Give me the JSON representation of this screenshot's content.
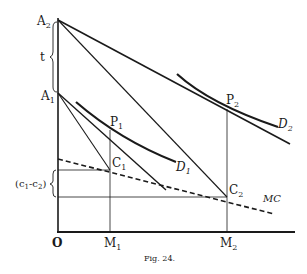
{
  "figure": {
    "caption": "Fig. 24.",
    "ink_color": "#1a1a1a",
    "background": "#ffffff"
  },
  "axes": {
    "origin_label": "O",
    "x_ticks": [
      {
        "label": "M",
        "sub": "1"
      },
      {
        "label": "M",
        "sub": "2"
      }
    ]
  },
  "points": {
    "A2": {
      "label": "A",
      "sub": "2"
    },
    "A1": {
      "label": "A",
      "sub": "1"
    },
    "P1": {
      "label": "P",
      "sub": "1"
    },
    "P2": {
      "label": "P",
      "sub": "2"
    },
    "C1": {
      "label": "C",
      "sub": "1"
    },
    "C2": {
      "label": "C",
      "sub": "2"
    }
  },
  "curves": {
    "D1": {
      "label": "D",
      "sub": "1"
    },
    "D2": {
      "label": "D",
      "sub": "2"
    },
    "MC": {
      "label": "MC"
    }
  },
  "annotations": {
    "t_label": "t",
    "cost_diff": {
      "open": "(c",
      "sub1": "1",
      "dash": "-c",
      "sub2": "2",
      "close": ")"
    }
  }
}
